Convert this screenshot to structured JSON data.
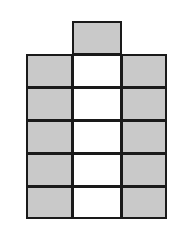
{
  "diagram": {
    "colors": {
      "shaded": "#c9c9c9",
      "unshaded": "#ffffff",
      "border": "#1a1a1a"
    },
    "grid": {
      "columns": 3,
      "rows": 5,
      "x_edges": [
        26,
        72,
        121,
        166
      ],
      "y_edges": [
        54,
        87,
        120,
        153,
        186,
        218
      ]
    },
    "top_square": {
      "column": 1,
      "x": 72,
      "y": 21,
      "w": 50,
      "h": 34,
      "fill": "shaded"
    },
    "cells": [
      {
        "row": 0,
        "col": 0,
        "fill": "shaded"
      },
      {
        "row": 0,
        "col": 1,
        "fill": "unshaded"
      },
      {
        "row": 0,
        "col": 2,
        "fill": "shaded"
      },
      {
        "row": 1,
        "col": 0,
        "fill": "shaded"
      },
      {
        "row": 1,
        "col": 1,
        "fill": "unshaded"
      },
      {
        "row": 1,
        "col": 2,
        "fill": "shaded"
      },
      {
        "row": 2,
        "col": 0,
        "fill": "shaded"
      },
      {
        "row": 2,
        "col": 1,
        "fill": "unshaded"
      },
      {
        "row": 2,
        "col": 2,
        "fill": "shaded"
      },
      {
        "row": 3,
        "col": 0,
        "fill": "shaded"
      },
      {
        "row": 3,
        "col": 1,
        "fill": "unshaded"
      },
      {
        "row": 3,
        "col": 2,
        "fill": "shaded"
      },
      {
        "row": 4,
        "col": 0,
        "fill": "shaded"
      },
      {
        "row": 4,
        "col": 1,
        "fill": "unshaded"
      },
      {
        "row": 4,
        "col": 2,
        "fill": "shaded"
      }
    ],
    "counts": {
      "shaded": 11,
      "unshaded": 5,
      "total": 16
    }
  }
}
